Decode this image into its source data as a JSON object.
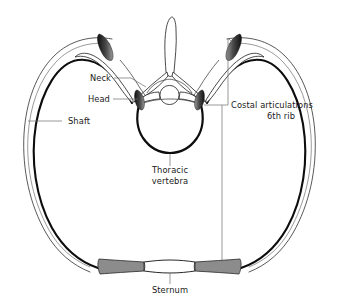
{
  "figure": {
    "background_color": "#ffffff",
    "ink_color": "#0d0d0d",
    "leader_color": "#6e6e6e",
    "cartilage_color": "#8c8c8c",
    "facet_color": "#2f2f2f"
  },
  "labels": {
    "neck": "Neck",
    "head": "Head",
    "shaft": "Shaft",
    "costal_articulations_line1": "Costal articulations",
    "costal_articulations_line2": "6th rib",
    "thoracic_vertebra_line1": "Thoracic",
    "thoracic_vertebra_line2": "vertebra",
    "sternum": "Sternum"
  },
  "structures": {
    "rib": "6th rib pair forming the thoracic cage outline",
    "vertebra": "Thoracic vertebra with spinous process, transverse processes, vertebral foramen and body",
    "costal_facets": "Dark shaded articular facets on transverse processes and vertebral body",
    "costal_cartilage": "Grey shaded costal cartilages joining ribs to sternum",
    "sternum": "White sternum body at the anterior midline"
  }
}
